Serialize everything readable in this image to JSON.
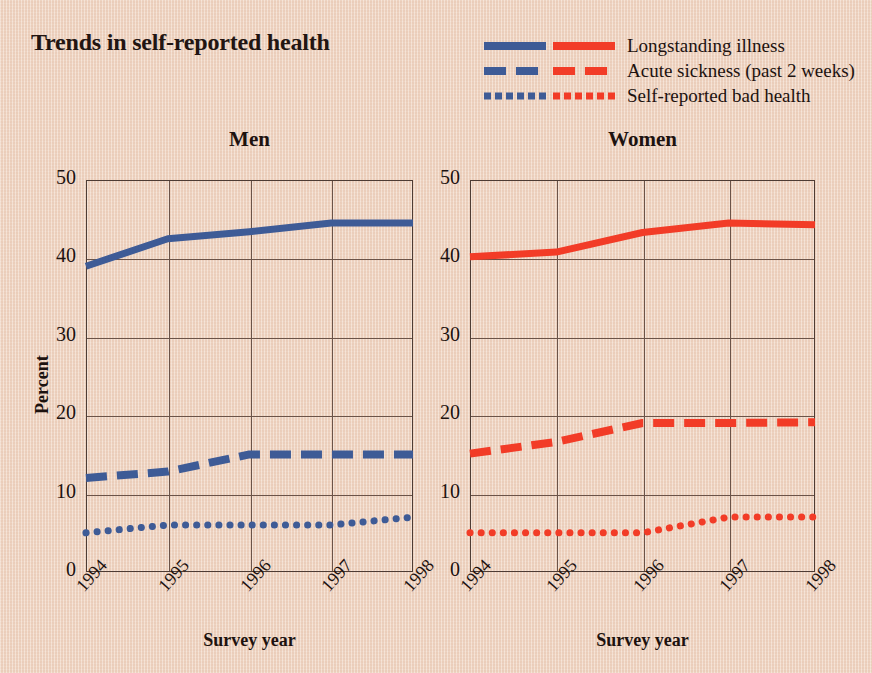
{
  "title": "Trends in self-reported health",
  "legend": {
    "entries": [
      {
        "label": "Longstanding illness",
        "style": "solid",
        "blue": "#3e5b96",
        "red": "#f23c27"
      },
      {
        "label": "Acute sickness (past 2 weeks)",
        "style": "dashed",
        "blue": "#3e5b96",
        "red": "#f23c27"
      },
      {
        "label": "Self-reported bad health",
        "style": "dotted",
        "blue": "#3e5b96",
        "red": "#f23c27"
      }
    ]
  },
  "colors": {
    "background": "#f1d7c5",
    "blue": "#3e5b96",
    "red": "#f23c27",
    "axis": "#4e3c34",
    "grid": "#6b5348",
    "text": "#1d120f"
  },
  "axes": {
    "y_label": "Percent",
    "y_ticks": [
      "0",
      "10",
      "20",
      "30",
      "40",
      "50"
    ],
    "y_min": 0,
    "y_max": 50,
    "x_label": "Survey year",
    "x_ticks": [
      "1994",
      "1995",
      "1996",
      "1997",
      "1998"
    ]
  },
  "panels": [
    {
      "title": "Men"
    },
    {
      "title": "Women"
    }
  ],
  "chart_data": {
    "type": "line",
    "title": "Trends in self-reported health",
    "xlabel": "Survey year",
    "ylabel": "Percent",
    "ylim": [
      0,
      50
    ],
    "grid": true,
    "legend_position": "top-right",
    "categories": [
      "1994",
      "1995",
      "1996",
      "1997",
      "1998"
    ],
    "panels": [
      {
        "name": "Men",
        "color": "#3e5b96",
        "series": [
          {
            "name": "Longstanding illness",
            "style": "solid",
            "values": [
              39.0,
              42.5,
              43.4,
              44.5,
              44.5
            ]
          },
          {
            "name": "Acute sickness (past 2 weeks)",
            "style": "dashed",
            "values": [
              12.0,
              12.8,
              15.0,
              15.0,
              15.0
            ]
          },
          {
            "name": "Self-reported bad health",
            "style": "dotted",
            "values": [
              5.0,
              6.0,
              6.0,
              6.0,
              7.0
            ]
          }
        ]
      },
      {
        "name": "Women",
        "color": "#f23c27",
        "series": [
          {
            "name": "Longstanding illness",
            "style": "solid",
            "values": [
              40.2,
              40.8,
              43.3,
              44.5,
              44.3
            ]
          },
          {
            "name": "Acute sickness (past 2 weeks)",
            "style": "dashed",
            "values": [
              15.1,
              16.6,
              19.0,
              19.0,
              19.1
            ]
          },
          {
            "name": "Self-reported bad health",
            "style": "dotted",
            "values": [
              5.0,
              5.0,
              5.0,
              7.0,
              7.0
            ]
          }
        ]
      }
    ]
  }
}
